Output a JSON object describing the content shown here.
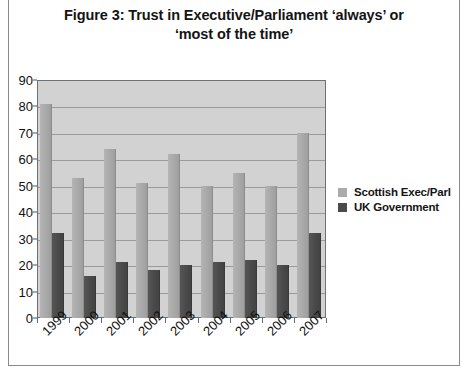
{
  "figure": {
    "title_line1": "Figure 3: Trust in Executive/Parliament ‘always’ or",
    "title_line2": "‘most of the time’"
  },
  "legend": {
    "position": "right",
    "items": [
      {
        "label": "Scottish Exec/Parl",
        "color": "#ababab",
        "swatch_name": "legend-swatch-scottish"
      },
      {
        "label": "UK Government",
        "color": "#4a4a4a",
        "swatch_name": "legend-swatch-uk"
      }
    ]
  },
  "chart_data": {
    "type": "bar",
    "title": "Figure 3: Trust in Executive/Parliament ‘always’ or ‘most of the time’",
    "xlabel": "",
    "ylabel": "",
    "ylim": [
      0,
      90
    ],
    "yticks": [
      0,
      10,
      20,
      30,
      40,
      50,
      60,
      70,
      80,
      90
    ],
    "grid": true,
    "legend_position": "right",
    "plot_background": "#d2d2d2",
    "categories": [
      "1999",
      "2000",
      "2001",
      "2002",
      "2003",
      "2004",
      "2005",
      "2006",
      "2007"
    ],
    "series": [
      {
        "name": "Scottish Exec/Parl",
        "color": "#ababab",
        "values": [
          81,
          53,
          64,
          51,
          62,
          50,
          55,
          50,
          70
        ]
      },
      {
        "name": "UK Government",
        "color": "#4a4a4a",
        "values": [
          32,
          16,
          21,
          18,
          20,
          21,
          22,
          20,
          32
        ]
      }
    ]
  }
}
